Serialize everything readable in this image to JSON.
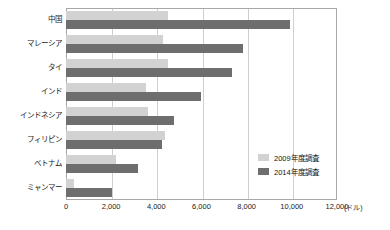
{
  "chart_data": {
    "type": "bar",
    "orientation": "horizontal",
    "title": "",
    "xlabel": "(ドル)",
    "ylabel": "",
    "xlim": [
      0,
      12000
    ],
    "xticks": [
      "0",
      "2,000",
      "4,000",
      "6,000",
      "8,000",
      "10,000",
      "12,000"
    ],
    "xtick_values": [
      0,
      2000,
      4000,
      6000,
      8000,
      10000,
      12000
    ],
    "grid": true,
    "grid_axis": "x",
    "legend_position": "inside-bottom-right",
    "categories": [
      "中国",
      "マレーシア",
      "タイ",
      "インド",
      "インドネシア",
      "フィリピン",
      "ベトナム",
      "ミャンマー"
    ],
    "series": [
      {
        "name": "2009年度調査",
        "color": "#d2d2d2",
        "values": [
          4500,
          4300,
          4500,
          3540,
          3630,
          4380,
          2220,
          360
        ]
      },
      {
        "name": "2014年度調査",
        "color": "#6e6e6e",
        "values": [
          9900,
          7840,
          7350,
          5980,
          4780,
          4250,
          3190,
          2040
        ]
      }
    ]
  },
  "axis": {
    "unit_label": "(ドル)"
  },
  "colors": {
    "series_2009": "#d2d2d2",
    "series_2014": "#6e6e6e",
    "grid": "#cfcfcf",
    "frame": "#a8a8a8",
    "text": "#111111"
  }
}
